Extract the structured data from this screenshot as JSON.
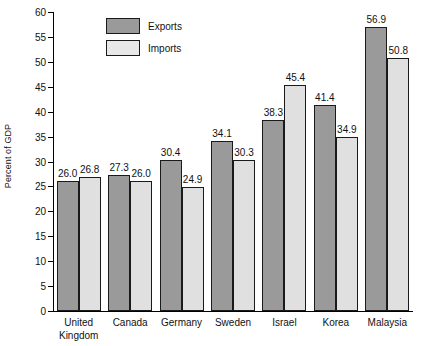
{
  "chart_data": {
    "type": "bar",
    "title": "",
    "xlabel": "",
    "ylabel": "Percent of GDP",
    "ylim": [
      0,
      60
    ],
    "ytick_step": 5,
    "yticks": [
      0,
      5,
      10,
      15,
      20,
      25,
      30,
      35,
      40,
      45,
      50,
      55,
      60
    ],
    "grid": false,
    "legend_position": "top-left-inside",
    "categories": [
      "United Kingdom",
      "Canada",
      "Germany",
      "Sweden",
      "Israel",
      "Korea",
      "Malaysia"
    ],
    "category_lines": [
      [
        "United",
        "Kingdom"
      ],
      [
        "Canada"
      ],
      [
        "Germany"
      ],
      [
        "Sweden"
      ],
      [
        "Israel"
      ],
      [
        "Korea"
      ],
      [
        "Malaysia"
      ]
    ],
    "series": [
      {
        "name": "Exports",
        "color": "#9a9a9a",
        "values": [
          26.0,
          27.3,
          30.4,
          34.1,
          38.3,
          41.4,
          56.9
        ],
        "labels": [
          "26.0",
          "27.3",
          "30.4",
          "34.1",
          "38.3",
          "41.4",
          "56.9"
        ]
      },
      {
        "name": "Imports",
        "color": "#e0e0e0",
        "values": [
          26.8,
          26.0,
          24.9,
          30.3,
          45.4,
          34.9,
          50.8
        ],
        "labels": [
          "26.8",
          "26.0",
          "24.9",
          "30.3",
          "45.4",
          "34.9",
          "50.8"
        ]
      }
    ]
  },
  "legend": {
    "items": [
      {
        "label": "Exports",
        "swatch": "exports"
      },
      {
        "label": "Imports",
        "swatch": "imports"
      }
    ]
  },
  "colors": {
    "exports": "#9a9a9a",
    "imports": "#e0e0e0",
    "outline": "#1a1a1a",
    "axis": "#000000",
    "background": "#ffffff"
  }
}
